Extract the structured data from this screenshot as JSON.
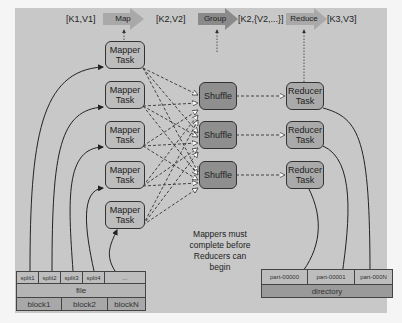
{
  "header": {
    "kv1": "[K1,V1]",
    "map": "Map",
    "kv2": "[K2,V2]",
    "group": "Group",
    "kv2list": "[K2,{V2,...}]",
    "reduce": "Reduce",
    "kv3": "[K3,V3]"
  },
  "mappers": [
    {
      "label": "Mapper\nTask"
    },
    {
      "label": "Mapper\nTask"
    },
    {
      "label": "Mapper\nTask"
    },
    {
      "label": "Mapper\nTask"
    },
    {
      "label": "Mapper\nTask"
    }
  ],
  "shuffles": [
    {
      "label": "Shuffle"
    },
    {
      "label": "Shuffle"
    },
    {
      "label": "Shuffle"
    }
  ],
  "reducers": [
    {
      "label": "Reducer\nTask"
    },
    {
      "label": "Reducer\nTask"
    },
    {
      "label": "Reducer\nTask"
    }
  ],
  "input": {
    "splits": [
      "split1",
      "split2",
      "split3",
      "split4",
      "..."
    ],
    "file": "file",
    "blocks": [
      "block1",
      "block2",
      "blockN"
    ]
  },
  "output": {
    "parts": [
      "part-00000",
      "part-00001",
      "part-000N"
    ],
    "directory": "directory"
  },
  "note": "Mappers must\ncomplete before\nReducers can\nbegin",
  "colors": {
    "panel": "#c8c8c8",
    "mapper": "#bdbdbd",
    "shuffle": "#8f8f8f",
    "reducer": "#aaaaaa",
    "stage_arrow": "#a9a9a9"
  }
}
